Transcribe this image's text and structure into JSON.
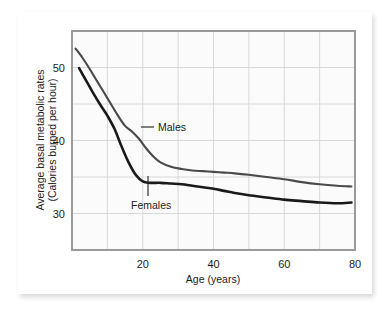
{
  "chart_data": {
    "type": "line",
    "title": "",
    "xlabel": "Age (years)",
    "ylabel": "Average basal metabolic rates (Calories burned per hour)",
    "ylabel_line1": "Average basal metabolic rates",
    "ylabel_line2": "(Calories burned per hour)",
    "xlim": [
      0,
      80
    ],
    "ylim": [
      25,
      55
    ],
    "xticks": [
      20,
      40,
      60,
      80
    ],
    "xtick_labels": [
      "20",
      "40",
      "60",
      "80"
    ],
    "yticks": [
      30,
      40,
      50
    ],
    "ytick_labels": [
      "30",
      "40",
      "50"
    ],
    "xgrid_step": 10,
    "ygrid_step": 5,
    "grid": true,
    "legend_position": "inline-annotations",
    "series": [
      {
        "name": "Males",
        "color": "#4a4a4a",
        "x": [
          1,
          3,
          5,
          7,
          9,
          11,
          13,
          15,
          17,
          19,
          21,
          23,
          25,
          28,
          31,
          34,
          37,
          40,
          43,
          46,
          50,
          55,
          60,
          65,
          70,
          75,
          79
        ],
        "values": [
          52.6,
          51.3,
          49.8,
          48.2,
          46.6,
          45.0,
          43.4,
          42.0,
          41.2,
          40.2,
          38.9,
          37.8,
          37.0,
          36.4,
          36.1,
          35.9,
          35.8,
          35.7,
          35.6,
          35.5,
          35.3,
          35.0,
          34.7,
          34.3,
          34.0,
          33.8,
          33.7
        ]
      },
      {
        "name": "Females",
        "color": "#1a1a1a",
        "x": [
          2,
          4,
          6,
          8,
          10,
          12,
          14,
          16,
          18,
          20,
          22,
          25,
          28,
          31,
          34,
          37,
          40,
          43,
          46,
          50,
          55,
          60,
          65,
          70,
          75,
          79
        ],
        "values": [
          49.9,
          48.2,
          46.5,
          44.9,
          43.4,
          41.6,
          39.2,
          37.0,
          35.3,
          34.4,
          34.2,
          34.2,
          34.1,
          34.0,
          33.8,
          33.6,
          33.4,
          33.1,
          32.8,
          32.5,
          32.2,
          31.9,
          31.7,
          31.5,
          31.4,
          31.5
        ]
      }
    ],
    "annotations": [
      {
        "name": "Males",
        "text": "Males",
        "leader": "horizontal"
      },
      {
        "name": "Females",
        "text": "Females",
        "leader": "vertical"
      }
    ]
  },
  "style": {
    "plot_background": "#fbfbfb",
    "grid_color": "#d8d8d8",
    "frame_color": "#9a9a9a",
    "card_background": "#ffffff",
    "page_background": "#ffffff",
    "text_color": "#1c1c1c"
  }
}
